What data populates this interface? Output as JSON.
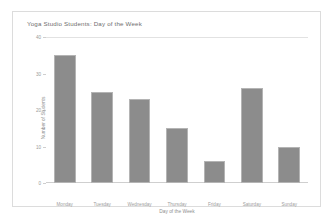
{
  "chart_data": {
    "type": "bar",
    "title": "Yoga Studio Students: Day of the Week",
    "xlabel": "Day of the Week",
    "ylabel": "Number of Students",
    "categories": [
      "Monday",
      "Tuesday",
      "Wednesday",
      "Thursday",
      "Friday",
      "Saturday",
      "Sunday"
    ],
    "values": [
      35,
      25,
      23,
      15,
      6,
      26,
      10
    ],
    "ylim": [
      0,
      40
    ],
    "yticks": [
      0,
      10,
      20,
      30,
      40
    ],
    "ytick_labels": [
      "0",
      "10",
      "20",
      "30",
      "40"
    ],
    "grid": true,
    "legend": null,
    "bar_color": "#8c8c8c",
    "bar_edge_color": "#b4b4b4",
    "axis_color": "#cfcfcf",
    "text_color": "#9a9a9a",
    "background": "#ffffff",
    "border_color": "#dcdcdc"
  }
}
